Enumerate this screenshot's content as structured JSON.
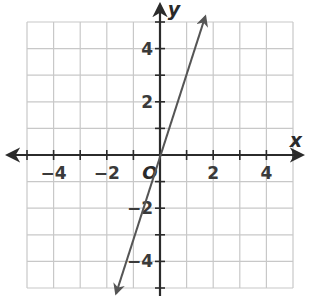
{
  "chart_data": {
    "type": "line",
    "title": "",
    "xlabel": "x",
    "ylabel": "y",
    "origin_label": "O",
    "xlim": [
      -5,
      5
    ],
    "ylim": [
      -5,
      5
    ],
    "grid": true,
    "grid_step": 1,
    "x_ticks": [
      -4,
      -2,
      2,
      4
    ],
    "y_ticks": [
      -4,
      -2,
      2,
      4
    ],
    "x_tick_labels": [
      "−4",
      "−2",
      "2",
      "4"
    ],
    "y_tick_labels": [
      "−4",
      "−2",
      "2",
      "4"
    ],
    "series": [
      {
        "name": "y = 3x",
        "equation": "y = 3x",
        "slope": 3,
        "intercept": 0,
        "x": [
          -1.65,
          1.7
        ],
        "y": [
          -5.2,
          5.2
        ],
        "arrows_both_ends": true,
        "color": "#555555"
      }
    ]
  },
  "colors": {
    "grid": "#c8c8c8",
    "axis": "#2b2b2b",
    "line": "#555555"
  }
}
